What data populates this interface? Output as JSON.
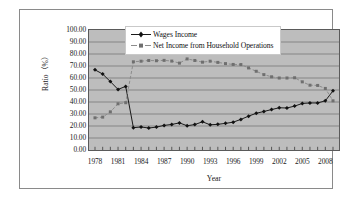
{
  "chart_data": {
    "type": "line",
    "title": "",
    "xlabel": "Year",
    "ylabel": "Ratio（%）",
    "ylim": [
      0,
      100
    ],
    "ytick_step": 10,
    "ytick_labels": [
      "100.00",
      "90.00",
      "80.00",
      "70.00",
      "60.00",
      "50.00",
      "40.00",
      "30.00",
      "20.00",
      "10.00",
      "0.00"
    ],
    "xtick_labels": [
      "1978",
      "1981",
      "1984",
      "1987",
      "1990",
      "1993",
      "1996",
      "1999",
      "2002",
      "2005",
      "2008"
    ],
    "xtick_step": 3,
    "grid": "horizontal",
    "legend_position": "top-center",
    "plot_background": "#bdbdbd",
    "x": [
      1978,
      1979,
      1980,
      1981,
      1982,
      1983,
      1984,
      1985,
      1986,
      1987,
      1988,
      1989,
      1990,
      1991,
      1992,
      1993,
      1994,
      1995,
      1996,
      1997,
      1998,
      1999,
      2000,
      2001,
      2002,
      2003,
      2004,
      2005,
      2006,
      2007,
      2008,
      2009
    ],
    "series": [
      {
        "name": "Wages Income",
        "color": "#1a1a1a",
        "marker": "diamond",
        "line_style": "solid",
        "values": [
          66.8,
          63.3,
          57.0,
          50.5,
          53.0,
          18.6,
          19.2,
          18.3,
          19.1,
          20.5,
          21.3,
          22.6,
          20.2,
          21.2,
          23.5,
          21.0,
          21.4,
          22.2,
          23.2,
          25.5,
          28.2,
          30.6,
          32.1,
          33.7,
          35.2,
          35.0,
          36.6,
          38.8,
          39.2,
          39.2,
          41.0,
          49.3
        ]
      },
      {
        "name": "Net Income from Household Operations",
        "color": "#8c8c8c",
        "marker": "square",
        "line_style": "dashed",
        "values": [
          26.8,
          27.4,
          31.8,
          38.5,
          39.4,
          73.5,
          74.0,
          74.6,
          74.4,
          74.7,
          74.1,
          72.4,
          75.9,
          74.6,
          73.2,
          74.0,
          73.0,
          72.0,
          71.3,
          71.2,
          68.4,
          65.6,
          62.8,
          61.0,
          60.0,
          60.0,
          60.2,
          56.8,
          54.0,
          53.8,
          51.3,
          41.0
        ]
      }
    ]
  },
  "axes": {
    "y_title": "Ratio（%）",
    "x_title": "Year"
  },
  "legend": {
    "items": [
      {
        "label": "Wages Income",
        "marker": "diamond-marker-icon",
        "color": "#1a1a1a"
      },
      {
        "label": "Net Income from Household Operations",
        "marker": "square-marker-icon",
        "color": "#8c8c8c"
      }
    ]
  }
}
